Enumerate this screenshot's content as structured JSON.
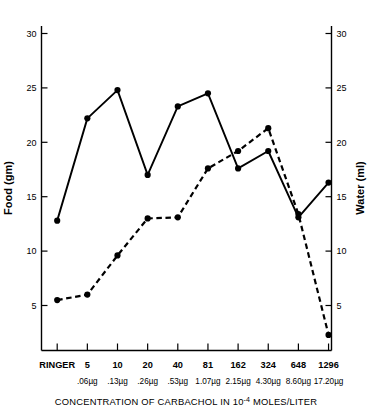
{
  "chart_data": {
    "type": "line",
    "title": "",
    "xlabel": "CONCENTRATION OF CARBACHOL IN 10⁻⁴ MOLES/LITER",
    "ylabel": "Food (gm)",
    "y2label": "Water (ml)",
    "ylim": [
      0,
      31.5
    ],
    "y2lim": [
      0,
      31.5
    ],
    "yticks": [
      5,
      10,
      15,
      20,
      25,
      30
    ],
    "y2ticks": [
      5,
      10,
      15,
      20,
      25,
      30
    ],
    "grid": false,
    "legend": "none",
    "categories": [
      "RINGER",
      "5",
      "10",
      "20",
      "40",
      "81",
      "162",
      "324",
      "648",
      "1296"
    ],
    "categories_sub": [
      "",
      ".06µg",
      ".13µg",
      ".26µg",
      ".53µg",
      "1.07µg",
      "2.15µg",
      "4.30µg",
      "8.60µg",
      "17.20µg"
    ],
    "series": [
      {
        "name": "Food (gm)",
        "axis": "left",
        "style": "solid",
        "marker": "filled-circle",
        "values": [
          12.8,
          22.2,
          24.8,
          17.0,
          23.3,
          24.5,
          17.6,
          19.2,
          13.1,
          16.3
        ]
      },
      {
        "name": "Water (ml)",
        "axis": "right",
        "style": "dashed",
        "marker": "filled-circle",
        "values": [
          5.5,
          6.0,
          9.6,
          13.0,
          13.1,
          17.6,
          19.2,
          21.3,
          13.4,
          2.3
        ]
      }
    ]
  },
  "axes": {
    "left": {
      "title": "Food (gm)",
      "ticks": [
        "30",
        "25",
        "20",
        "15",
        "10",
        "5"
      ]
    },
    "right": {
      "title": "Water (ml)",
      "ticks": [
        "30",
        "25",
        "20",
        "15",
        "10",
        "5"
      ]
    },
    "bottom": {
      "title_part1": "CONCENTRATION OF CARBACHOL IN 10",
      "title_sup": "-4",
      "title_part2": " MOLES/LITER",
      "categories": [
        "RINGER",
        "5",
        "10",
        "20",
        "40",
        "81",
        "162",
        "324",
        "648",
        "1296"
      ],
      "doses": [
        "",
        ".06µg",
        ".13µg",
        ".26µg",
        ".53µg",
        "1.07µg",
        "2.15µg",
        "4.30µg",
        "8.60µg",
        "17.20µg"
      ]
    }
  },
  "colors": {
    "ink": "#000000",
    "background": "#ffffff"
  }
}
